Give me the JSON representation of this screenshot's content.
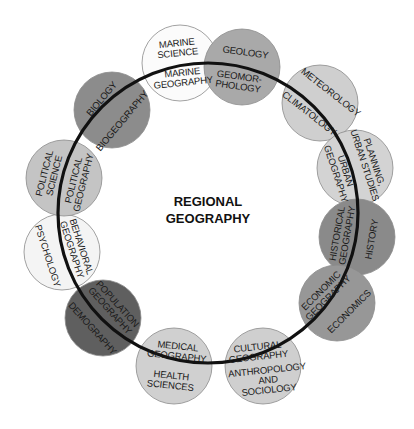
{
  "center": {
    "line1": "REGIONAL",
    "line2": "GEOGRAPHY"
  },
  "ring": {
    "cx": 208,
    "cy": 213,
    "r": 150,
    "color": "#111111"
  },
  "nodes": [
    {
      "id": "marine",
      "cx": 180,
      "cy": 63,
      "fill": "#fbfbfb",
      "outer": [
        "MARINE",
        "SCIENCE"
      ],
      "inner": [
        "MARINE",
        "GEOGRAPHY"
      ],
      "rot": -6
    },
    {
      "id": "geology",
      "cx": 242,
      "cy": 67,
      "fill": "#a9a9a9",
      "outer": [
        "GEOLOGY"
      ],
      "inner": [
        "GEOMOR-",
        "PHOLOGY"
      ],
      "rot": 8
    },
    {
      "id": "meteorology",
      "cx": 320,
      "cy": 103,
      "fill": "#cfcfcf",
      "outer": [
        "METEOROLOGY"
      ],
      "inner": [
        "CLIMATOLOGY"
      ],
      "rot": 38
    },
    {
      "id": "planning",
      "cx": 355,
      "cy": 168,
      "fill": "#d3d3d3",
      "outer": [
        "PLANNING,",
        "URBAN STUDIES"
      ],
      "inner": [
        "URBAN",
        "GEOGRAPHY"
      ],
      "rot": 72
    },
    {
      "id": "history",
      "cx": 357,
      "cy": 237,
      "fill": "#8a8a8a",
      "outer": [
        "HISTORY"
      ],
      "inner": [
        "HISTORICAL",
        "GEOGRAPHY"
      ],
      "rot": -80
    },
    {
      "id": "economics",
      "cx": 337,
      "cy": 303,
      "fill": "#979797",
      "outer": [
        "ECONOMICS"
      ],
      "inner": [
        "ECONOMIC",
        "GEOGRAPHY"
      ],
      "rot": -45
    },
    {
      "id": "cultural",
      "cx": 263,
      "cy": 366,
      "fill": "#cfcfcf",
      "outer": [
        "ANTHROPOLOGY",
        "AND",
        "SOCIOLOGY"
      ],
      "inner": [
        "CULTURAL",
        "GEOGRAPHY"
      ],
      "rot": -6
    },
    {
      "id": "medical",
      "cx": 174,
      "cy": 366,
      "fill": "#d0d0d0",
      "outer": [
        "HEALTH",
        "SCIENCES"
      ],
      "inner": [
        "MEDICAL",
        "GEOGRAPHY"
      ],
      "rot": 6
    },
    {
      "id": "population",
      "cx": 103,
      "cy": 318,
      "fill": "#5f5f5f",
      "outer": [
        "DEMOGRAPHY"
      ],
      "inner": [
        "POPULATION",
        "GEOGRAPHY"
      ],
      "rot": 48
    },
    {
      "id": "behavioral",
      "cx": 62,
      "cy": 252,
      "fill": "#f4f4f4",
      "outer": [
        "PSYCHOLOGY"
      ],
      "inner": [
        "BEHAVIORAL",
        "GEOGRAPHY"
      ],
      "rot": 72
    },
    {
      "id": "political",
      "cx": 64,
      "cy": 178,
      "fill": "#c4c4c4",
      "outer": [
        "POLITICAL",
        "SCIENCE"
      ],
      "inner": [
        "POLITICAL",
        "GEOGRAPHY"
      ],
      "rot": -76
    },
    {
      "id": "biology",
      "cx": 112,
      "cy": 110,
      "fill": "#8c8c8c",
      "outer": [
        "BIOLOGY"
      ],
      "inner": [
        "BIOGEOGRAPHY"
      ],
      "rot": -50
    }
  ],
  "node_radius": 38
}
